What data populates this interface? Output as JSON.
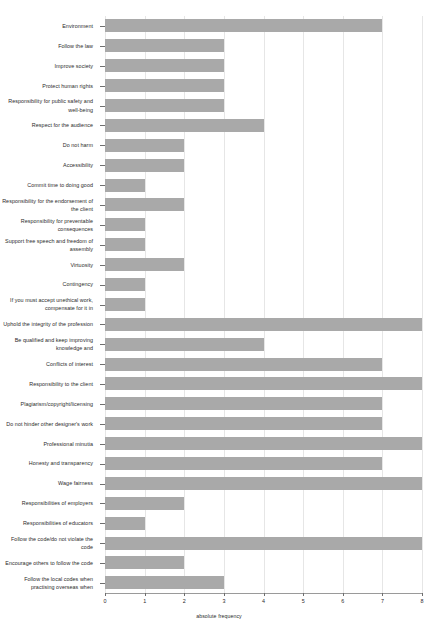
{
  "chart_data": {
    "type": "bar",
    "orientation": "horizontal",
    "title": "",
    "xlabel": "absolute frequency",
    "ylabel": "",
    "xlim": [
      0,
      8
    ],
    "xticks": [
      0,
      1,
      2,
      3,
      4,
      5,
      6,
      7,
      8
    ],
    "xtick_labels": [
      "0",
      "1",
      "2",
      "3",
      "4",
      "5",
      "6",
      "7",
      "8"
    ],
    "grid": "vertical",
    "legend": "none",
    "bar_color": "#a9a9a9",
    "categories": [
      "Environment",
      "Follow the law",
      "Improve society",
      "Protect human rights",
      "Responsibility for public safety and well-being",
      "Respect for the audience",
      "Do not harm",
      "Accessibility",
      "Commit time to doing good",
      "Responsibility for the endorsement of the client",
      "Responsibility for preventable consequences",
      "Support free speech and freedom of assembly",
      "Virtuosity",
      "Contingency",
      "If you must accept unethical work, compensate for it in",
      "Uphold the integrity of the profession",
      "Be qualified and keep improving knowledge and",
      "Conflicts of interest",
      "Responsibility to the client",
      "Plagiarism/copyright/licensing",
      "Do not hinder other designer's work",
      "Professional minutia",
      "Honesty and transparency",
      "Wage fairness",
      "Responsibilities of employers",
      "Responsibilities of educators",
      "Follow the code/do not violate the code",
      "Encourage others to follow the code",
      "Follow the local codes when practising overseas when"
    ],
    "values": [
      7,
      3,
      3,
      3,
      3,
      4,
      2,
      2,
      1,
      2,
      1,
      1,
      2,
      1,
      1,
      8,
      4,
      7,
      8,
      7,
      7,
      8,
      7,
      8,
      2,
      1,
      8,
      2,
      3
    ]
  }
}
